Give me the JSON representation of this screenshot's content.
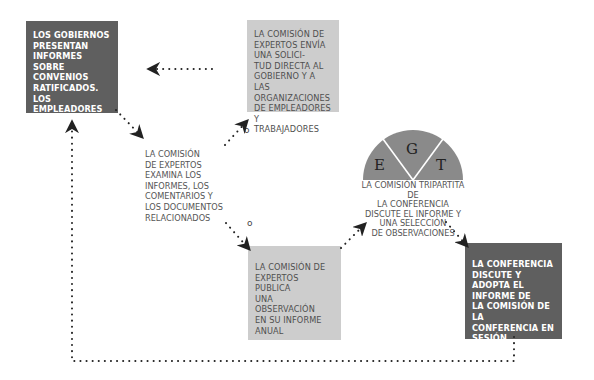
{
  "diagram": {
    "type": "flow",
    "nodes": [
      {
        "id": "gobiernos",
        "style": "dark",
        "lines": [
          "LOS GOBIERNOS",
          "PRESENTAN INFORMES",
          "SOBRE CONVENIOS",
          "RATIFICADOS. LOS",
          "EMPLEADORES",
          "Y TRABAJADORES PUE-",
          "DEN HACER COMENTA-",
          "RIOS AL RESPECTO"
        ]
      },
      {
        "id": "solicitud",
        "style": "light",
        "lines": [
          "LA COMISIÓN DE",
          "EXPERTOS ENVÍA",
          "UNA SOLICI-",
          "TUD DIRECTA AL",
          "GOBIERNO Y A LAS",
          "ORGANIZACIONES",
          "DE EMPLEADORES Y",
          "TRABAJADORES"
        ]
      },
      {
        "id": "examina",
        "style": "plain",
        "lines": [
          "LA COMISIÓN",
          "DE EXPERTOS",
          "EXAMINA LOS",
          "INFORMES, LOS",
          "COMENTARIOS Y",
          "LOS DOCUMENTOS",
          "RELACIONADOS"
        ]
      },
      {
        "id": "observacion",
        "style": "light",
        "lines": [
          "LA COMISIÓN DE",
          "EXPERTOS PUBLICA",
          "UNA OBSERVACIÓN",
          "EN SU INFORME",
          "ANUAL"
        ]
      },
      {
        "id": "tripartita",
        "style": "semicircle",
        "segments": [
          "E",
          "G",
          "T"
        ],
        "lines": [
          "LA COMISIÓN TRIPARTITA",
          "DE",
          "LA CONFERENCIA",
          "DISCUTE EL INFORME Y",
          "UNA SELECCIÓN",
          "DE OBSERVACIONES"
        ]
      },
      {
        "id": "plenaria",
        "style": "dark",
        "lines": [
          "LA CONFERENCIA",
          "DISCUTE Y ADOPTA EL",
          "INFORME DE",
          "LA COMISIÓN DE LA",
          "CONFERENCIA EN",
          "SESIÓN PLENARIA"
        ]
      }
    ],
    "branch_labels": {
      "upper": "o",
      "lower": "o"
    },
    "edges": [
      {
        "from": "gobiernos",
        "to": "examina"
      },
      {
        "from": "examina",
        "to": "solicitud",
        "label": "o"
      },
      {
        "from": "solicitud",
        "to": "gobiernos"
      },
      {
        "from": "examina",
        "to": "observacion",
        "label": "o"
      },
      {
        "from": "observacion",
        "to": "tripartita"
      },
      {
        "from": "tripartita",
        "to": "plenaria"
      },
      {
        "from": "plenaria",
        "to": "gobiernos"
      }
    ],
    "colors": {
      "dark": "#5f5f5f",
      "light": "#cdcdcd",
      "semicircle": "#8a8a8a",
      "arrow": "#222222"
    }
  }
}
